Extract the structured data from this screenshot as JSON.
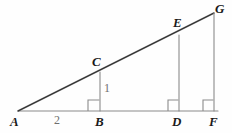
{
  "figure": {
    "kind": "geometry-diagram",
    "background_color": "#fefefe",
    "stroke_color": "#4d4d4d",
    "hypotenuse_color": "#333333",
    "label_color": "#1a1a1a",
    "measure_color": "#6e6e6e",
    "baseline": {
      "name": "segment-AF",
      "x1": 18,
      "y1": 111,
      "x2": 218,
      "y2": 111
    },
    "hypotenuse": {
      "name": "ray-AG",
      "x1": 18,
      "y1": 111,
      "x2": 214,
      "y2": 13
    },
    "verticals": [
      {
        "name": "segment-BC",
        "x": 100,
        "y_top": 72,
        "y_bottom": 111
      },
      {
        "name": "segment-DE",
        "x": 179,
        "y_top": 35,
        "y_bottom": 111
      },
      {
        "name": "segment-FG",
        "x": 214,
        "y_top": 13,
        "y_bottom": 111
      }
    ],
    "right_angle_marks": [
      {
        "name": "right-angle-at-B",
        "x": 88,
        "y": 100,
        "size": 11
      },
      {
        "name": "right-angle-at-D",
        "x": 168,
        "y": 100,
        "size": 11
      },
      {
        "name": "right-angle-at-F",
        "x": 203,
        "y": 100,
        "size": 11
      }
    ],
    "vertex_labels": [
      {
        "id": "A",
        "text": "A",
        "x": 10,
        "y": 115
      },
      {
        "id": "B",
        "text": "B",
        "x": 95,
        "y": 115
      },
      {
        "id": "C",
        "text": "C",
        "x": 92,
        "y": 55
      },
      {
        "id": "D",
        "text": "D",
        "x": 172,
        "y": 115
      },
      {
        "id": "E",
        "text": "E",
        "x": 173,
        "y": 16
      },
      {
        "id": "F",
        "text": "F",
        "x": 209,
        "y": 115
      },
      {
        "id": "G",
        "text": "G",
        "x": 215,
        "y": 2
      }
    ],
    "measure_labels": [
      {
        "id": "AB",
        "text": "2",
        "x": 54,
        "y": 114
      },
      {
        "id": "BC",
        "text": "1",
        "x": 104,
        "y": 82
      }
    ]
  }
}
